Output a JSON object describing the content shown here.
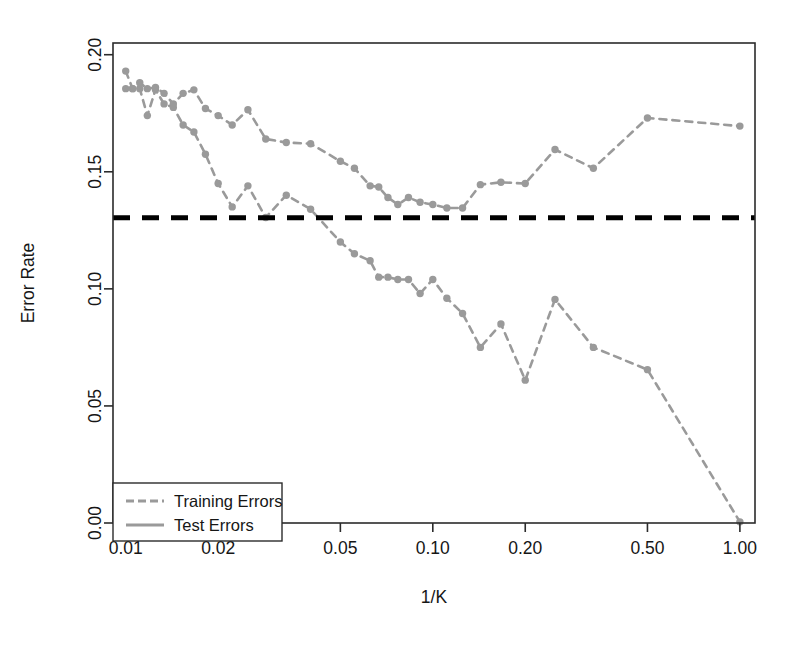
{
  "chart_data": {
    "type": "line",
    "title": "",
    "subtitle": "",
    "xlabel": "1/K",
    "ylabel": "Error Rate",
    "xscale": "log",
    "yscale": "linear",
    "xlim": [
      0.00909,
      1.12
    ],
    "ylim": [
      0.0,
      0.205
    ],
    "grid": false,
    "legend_position": "bottom-left",
    "xticks": [
      0.01,
      0.02,
      0.05,
      0.1,
      0.2,
      0.5,
      1.0
    ],
    "xtick_labels": [
      "0.01",
      "0.02",
      "0.05",
      "0.10",
      "0.20",
      "0.50",
      "1.00"
    ],
    "yticks": [
      0.0,
      0.05,
      0.1,
      0.15,
      0.2
    ],
    "ytick_labels": [
      "0.00",
      "0.05",
      "0.10",
      "0.15",
      "0.20"
    ],
    "annotations": [
      {
        "name": "bayes-error-line",
        "type": "hline",
        "y": 0.1304,
        "style": "dashed",
        "color": "#000000",
        "label": ""
      }
    ],
    "series": [
      {
        "name": "Training Errors",
        "color": "#9a9a9a",
        "linestyle": "dashed",
        "marker": "circle",
        "x": [
          0.01,
          0.01053,
          0.01111,
          0.01176,
          0.0125,
          0.01333,
          0.01429,
          0.01538,
          0.01667,
          0.01818,
          0.02,
          0.02222,
          0.025,
          0.02857,
          0.03333,
          0.04,
          0.05,
          0.05556,
          0.0625,
          0.06667,
          0.07143,
          0.07692,
          0.08333,
          0.09091,
          0.1,
          0.11111,
          0.125,
          0.14286,
          0.16667,
          0.2,
          0.25,
          0.33333,
          0.5,
          1.0
        ],
        "y": [
          0.1855,
          0.1855,
          0.1855,
          0.174,
          0.185,
          0.179,
          0.1775,
          0.17,
          0.167,
          0.1575,
          0.145,
          0.135,
          0.144,
          0.1305,
          0.14,
          0.134,
          0.12,
          0.115,
          0.112,
          0.105,
          0.105,
          0.104,
          0.104,
          0.098,
          0.104,
          0.096,
          0.0895,
          0.075,
          0.085,
          0.061,
          0.0955,
          0.075,
          0.0655,
          0.0005
        ]
      },
      {
        "name": "Test Errors",
        "color": "#9a9a9a",
        "linestyle": "dashed",
        "marker": "circle",
        "x": [
          0.01,
          0.01053,
          0.01111,
          0.01176,
          0.0125,
          0.01333,
          0.01429,
          0.01538,
          0.01667,
          0.01818,
          0.02,
          0.02222,
          0.025,
          0.02857,
          0.03333,
          0.04,
          0.05,
          0.05556,
          0.0625,
          0.06667,
          0.07143,
          0.07692,
          0.08333,
          0.09091,
          0.1,
          0.11111,
          0.125,
          0.14286,
          0.16667,
          0.2,
          0.25,
          0.33333,
          0.5,
          1.0
        ],
        "y": [
          0.193,
          0.1855,
          0.188,
          0.1855,
          0.186,
          0.1835,
          0.179,
          0.1835,
          0.185,
          0.177,
          0.174,
          0.17,
          0.1765,
          0.164,
          0.1625,
          0.162,
          0.1545,
          0.1515,
          0.144,
          0.1435,
          0.139,
          0.136,
          0.139,
          0.137,
          0.136,
          0.1345,
          0.1345,
          0.1445,
          0.1455,
          0.145,
          0.1595,
          0.1515,
          0.173,
          0.1695
        ]
      }
    ]
  },
  "legend": {
    "items": [
      {
        "label": "Training Errors",
        "color": "#9a9a9a",
        "linestyle": "dashed"
      },
      {
        "label": "Test Errors",
        "color": "#9a9a9a",
        "linestyle": "solid"
      }
    ]
  },
  "axes": {
    "x_title": "1/K",
    "y_title": "Error Rate"
  }
}
